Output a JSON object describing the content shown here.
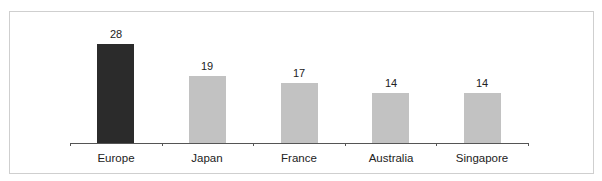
{
  "chart_data": {
    "type": "bar",
    "title": "",
    "xlabel": "",
    "ylabel": "",
    "categories": [
      "Europe",
      "Japan",
      "France",
      "Australia",
      "Singapore"
    ],
    "values": [
      28,
      19,
      17,
      14,
      14
    ],
    "data_labels": [
      "28",
      "19",
      "17",
      "14",
      "14"
    ],
    "colors": [
      "#2b2b2b",
      "#c2c2c2",
      "#c2c2c2",
      "#c2c2c2",
      "#c2c2c2"
    ],
    "highlighted_category": "Europe",
    "grid": false,
    "legend": null,
    "ylim": [
      0,
      28
    ]
  }
}
